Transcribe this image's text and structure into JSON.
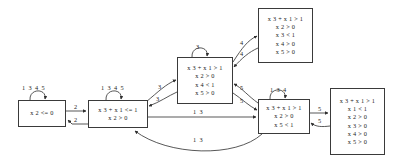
{
  "diagram": {
    "stroke_color": "#3a3a3a",
    "text_color": "#1a1a1a",
    "background": "#ffffff",
    "nodes": [
      {
        "id": "n1",
        "name": "state-x2-le-0",
        "lines": [
          "x 2 <= 0"
        ],
        "x": 18,
        "y": 100,
        "w": 48,
        "h": 27
      },
      {
        "id": "n2",
        "name": "state-x3-x1-le-1",
        "lines": [
          "x 3 + x 1 <= 1",
          "x 2 > 0"
        ],
        "x": 88,
        "y": 100,
        "w": 60,
        "h": 28
      },
      {
        "id": "n3",
        "name": "state-x4-lt-1",
        "lines": [
          "x 3 + x 1 > 1",
          "x 2 > 0",
          "x 4 < 1",
          "x 5 > 0"
        ],
        "x": 177,
        "y": 57,
        "w": 56,
        "h": 47
      },
      {
        "id": "n4",
        "name": "state-x3-lt-1",
        "lines": [
          "x 3 + x 1 > 1",
          "x 2 > 0",
          "x 3 < 1",
          "x 4 > 0",
          "x 5 > 0"
        ],
        "x": 258,
        "y": 8,
        "w": 55,
        "h": 55
      },
      {
        "id": "n5",
        "name": "state-x5-lt-1",
        "lines": [
          "x 3 + x 1 > 1",
          "x 2 > 0",
          "x 5 < 1"
        ],
        "x": 258,
        "y": 99,
        "w": 52,
        "h": 35
      },
      {
        "id": "n6",
        "name": "state-x1-lt-1",
        "lines": [
          "x 3 + x 1 > 1",
          "x 1 < 1",
          "x 2 > 0",
          "x 3 > 0",
          "x 4 > 0",
          "x 5 > 0"
        ],
        "x": 330,
        "y": 88,
        "w": 55,
        "h": 67
      }
    ],
    "edge_labels": [
      {
        "name": "label-selfloop-n1",
        "text": "1 3 4 5",
        "x": 22,
        "y": 84
      },
      {
        "name": "label-selfloop-n2",
        "text": "1 3 4 5",
        "x": 101,
        "y": 84
      },
      {
        "name": "label-selfloop-n3",
        "text": "3",
        "x": 196,
        "y": 43
      },
      {
        "name": "label-selfloop-n5",
        "text": "1 3 4",
        "x": 270,
        "y": 86
      },
      {
        "name": "label-n1-to-n2",
        "text": "2",
        "x": 74,
        "y": 105
      },
      {
        "name": "label-n2-to-n1",
        "text": "2",
        "x": 74,
        "y": 117
      },
      {
        "name": "label-n2-to-n3",
        "text": "3",
        "x": 158,
        "y": 83
      },
      {
        "name": "label-n3-to-n2",
        "text": "3",
        "x": 156,
        "y": 95
      },
      {
        "name": "label-n3-to-n4",
        "text": "4",
        "x": 240,
        "y": 39
      },
      {
        "name": "label-n4-to-n3",
        "text": "4",
        "x": 240,
        "y": 50
      },
      {
        "name": "label-n5-to-n3",
        "text": "5",
        "x": 240,
        "y": 84
      },
      {
        "name": "label-n3-to-n5",
        "text": "5",
        "x": 240,
        "y": 97
      },
      {
        "name": "label-n2-to-n5",
        "text": "1 3",
        "x": 193,
        "y": 110
      },
      {
        "name": "label-n5-to-n2",
        "text": "1 3",
        "x": 193,
        "y": 138
      },
      {
        "name": "label-n5-to-n6",
        "text": "5",
        "x": 318,
        "y": 107
      },
      {
        "name": "label-n6-to-n5",
        "text": "5",
        "x": 318,
        "y": 118
      }
    ]
  }
}
